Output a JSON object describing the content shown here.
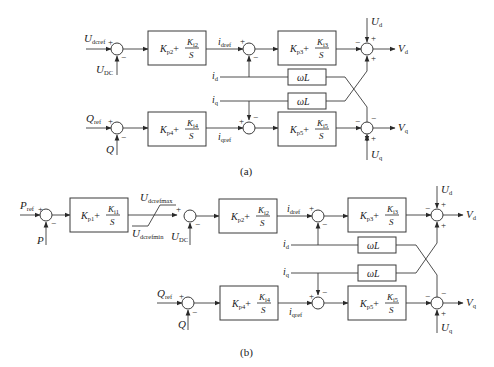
{
  "figure_a": {
    "caption": "(a)",
    "inputs": {
      "u_dcref": {
        "main": "U",
        "sub": "dcref"
      },
      "u_dc": {
        "main": "U",
        "sub": "DC"
      },
      "q_ref": {
        "main": "Q",
        "sub": "ref"
      },
      "q": {
        "main": "Q",
        "sub": ""
      },
      "i_d": {
        "main": "i",
        "sub": "d"
      },
      "i_q": {
        "main": "i",
        "sub": "q"
      },
      "u_d": {
        "main": "U",
        "sub": "d"
      },
      "u_q": {
        "main": "U",
        "sub": "q"
      }
    },
    "signals": {
      "i_dref": {
        "main": "i",
        "sub": "dref"
      },
      "i_qref": {
        "main": "i",
        "sub": "qref"
      }
    },
    "outputs": {
      "v_d": {
        "main": "V",
        "sub": "d"
      },
      "v_q": {
        "main": "V",
        "sub": "q"
      }
    },
    "blocks": {
      "pi2": {
        "kp": "K",
        "kp_sub": "p2",
        "ki": "K",
        "ki_sub": "i2",
        "den": "S",
        "plus": "+"
      },
      "pi3": {
        "kp": "K",
        "kp_sub": "p3",
        "ki": "K",
        "ki_sub": "i3",
        "den": "S",
        "plus": "+"
      },
      "pi4": {
        "kp": "K",
        "kp_sub": "p4",
        "ki": "K",
        "ki_sub": "i4",
        "den": "S",
        "plus": "+"
      },
      "pi5": {
        "kp": "K",
        "kp_sub": "p5",
        "ki": "K",
        "ki_sub": "i5",
        "den": "S",
        "plus": "+"
      },
      "wl_top": {
        "label": "ωL"
      },
      "wl_bottom": {
        "label": "ωL"
      }
    }
  },
  "figure_b": {
    "caption": "(b)",
    "inputs": {
      "p_ref": {
        "main": "P",
        "sub": "ref"
      },
      "p": {
        "main": "P",
        "sub": ""
      },
      "u_dc": {
        "main": "U",
        "sub": "DC"
      },
      "q_ref": {
        "main": "Q",
        "sub": "ref"
      },
      "q": {
        "main": "Q",
        "sub": ""
      },
      "i_d": {
        "main": "i",
        "sub": "d"
      },
      "i_q": {
        "main": "i",
        "sub": "q"
      },
      "u_d": {
        "main": "U",
        "sub": "d"
      },
      "u_q": {
        "main": "U",
        "sub": "q"
      }
    },
    "limiter": {
      "max": {
        "main": "U",
        "sub": "dcrefmax"
      },
      "min": {
        "main": "U",
        "sub": "dcrefmin"
      }
    },
    "signals": {
      "i_dref": {
        "main": "i",
        "sub": "dref"
      },
      "i_qref": {
        "main": "i",
        "sub": "qref"
      }
    },
    "outputs": {
      "v_d": {
        "main": "V",
        "sub": "d"
      },
      "v_q": {
        "main": "V",
        "sub": "q"
      }
    },
    "blocks": {
      "pi1": {
        "kp": "K",
        "kp_sub": "p1",
        "ki": "K",
        "ki_sub": "i1",
        "den": "S",
        "plus": "+"
      },
      "pi2": {
        "kp": "K",
        "kp_sub": "p2",
        "ki": "K",
        "ki_sub": "i2",
        "den": "S",
        "plus": "+"
      },
      "pi3": {
        "kp": "K",
        "kp_sub": "p3",
        "ki": "K",
        "ki_sub": "i3",
        "den": "S",
        "plus": "+"
      },
      "pi4": {
        "kp": "K",
        "kp_sub": "p4",
        "ki": "K",
        "ki_sub": "i4",
        "den": "S",
        "plus": "+"
      },
      "pi5": {
        "kp": "K",
        "kp_sub": "p5",
        "ki": "K",
        "ki_sub": "i5",
        "den": "S",
        "plus": "+"
      },
      "wl_top": {
        "label": "ωL"
      },
      "wl_bottom": {
        "label": "ωL"
      }
    }
  },
  "signs": {
    "plus": "+",
    "minus": "−"
  }
}
